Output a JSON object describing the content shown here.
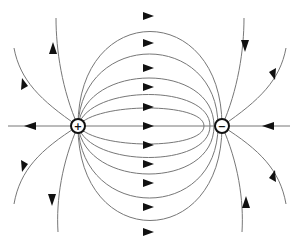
{
  "diagram": {
    "charges": [
      {
        "name": "positive-charge",
        "sign": "+",
        "cx": 78,
        "cy": 126
      },
      {
        "name": "negative-charge",
        "sign": "−",
        "cx": 222,
        "cy": 126
      }
    ],
    "midline_arrow_y": [
      16,
      43,
      68,
      87,
      107,
      126,
      145,
      164,
      183,
      207,
      232
    ],
    "colors": {
      "line": "#777777",
      "arrow": "#111111",
      "background": "#ffffff"
    }
  }
}
